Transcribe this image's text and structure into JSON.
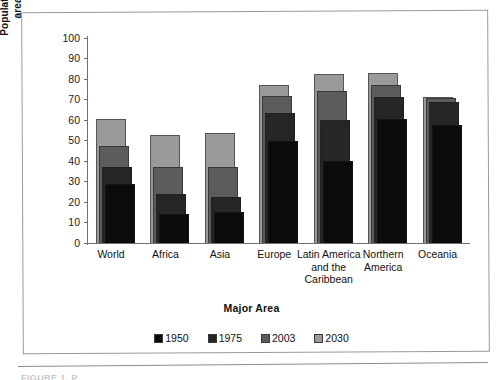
{
  "figure": {
    "caption_sliver": "FIGURE 1.  P"
  },
  "chart_data": {
    "type": "bar",
    "title": "",
    "xlabel": "Major Area",
    "ylabel": "Population living in urban areas (percentage)",
    "ylabel_lines": [
      "Population living in urban",
      "areas (percentage)"
    ],
    "categories": [
      "World",
      "Africa",
      "Asia",
      "Europe",
      "Latin America and the Caribbean",
      "Northern America",
      "Oceania"
    ],
    "category_label_lines": [
      [
        "World"
      ],
      [
        "Africa"
      ],
      [
        "Asia"
      ],
      [
        "Europe"
      ],
      [
        "Latin America",
        "and the",
        "Caribbean"
      ],
      [
        "Northern",
        "America"
      ],
      [
        "Oceania"
      ]
    ],
    "series": [
      {
        "name": "1950",
        "color": "#0b0b0b",
        "values": [
          29,
          14,
          15,
          50,
          40,
          60.5,
          57.5
        ]
      },
      {
        "name": "1975",
        "color": "#262626",
        "values": [
          37,
          24,
          22.5,
          63.5,
          60,
          71,
          69
        ]
      },
      {
        "name": "2003",
        "color": "#5c5c5c",
        "values": [
          47.5,
          37,
          37,
          71.5,
          74,
          77,
          70.5
        ]
      },
      {
        "name": "2030",
        "color": "#9a9a9a",
        "values": [
          60.5,
          52.5,
          53.5,
          77,
          82.5,
          83,
          71
        ]
      }
    ],
    "ylim": [
      0,
      100
    ],
    "yticks": [
      0,
      10,
      20,
      30,
      40,
      50,
      60,
      70,
      80,
      90,
      100
    ],
    "ytick_labels": [
      "0",
      "10",
      "20",
      "30",
      "40",
      "50",
      "60",
      "70",
      "80",
      "90",
      "100"
    ],
    "grid": false,
    "legend_position": "bottom",
    "legend_entries": [
      "1950",
      "1975",
      "2003",
      "2030"
    ],
    "annotations": []
  }
}
